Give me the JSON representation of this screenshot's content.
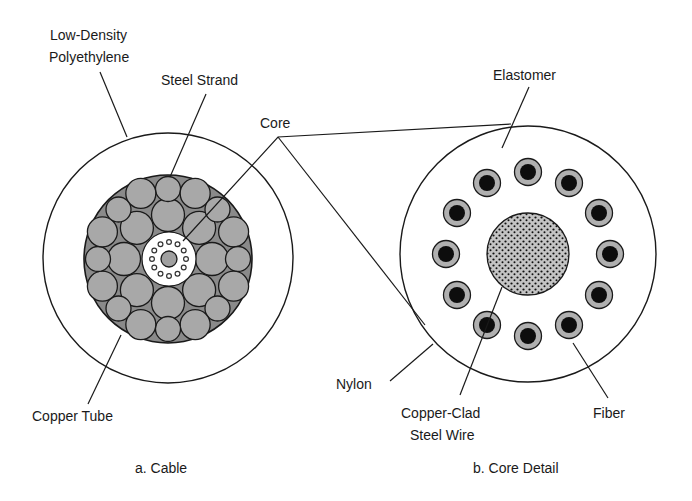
{
  "figure": {
    "panel_a": {
      "caption": "a. Cable",
      "labels": {
        "ldpe_line1": "Low-Density",
        "ldpe_line2": "Polyethylene",
        "steel_strand": "Steel Strand",
        "copper_tube": "Copper Tube"
      }
    },
    "shared": {
      "core": "Core"
    },
    "panel_b": {
      "caption": "b. Core Detail",
      "labels": {
        "elastomer": "Elastomer",
        "nylon": "Nylon",
        "ccsw_line1": "Copper-Clad",
        "ccsw_line2": "Steel Wire",
        "fiber": "Fiber"
      },
      "fiber_count": 12
    },
    "colors": {
      "line": "#1a1a1a",
      "strand_fill": "#a8a8a8",
      "bundle_fill": "#8a8a8a",
      "fiber_core": "#0d0d0d",
      "fiber_cladding": "#b0b0b0",
      "wire_fill": "#bdbdbd"
    }
  }
}
